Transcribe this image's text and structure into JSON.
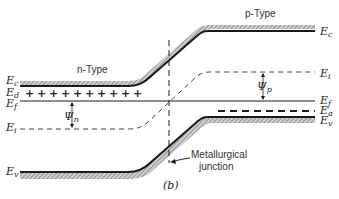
{
  "figure": {
    "caption": "(b)",
    "regions": {
      "n_type": "n-Type",
      "p_type": "p-Type"
    },
    "junction_label_line1": "Metallurgical",
    "junction_label_line2": "junction",
    "levels": {
      "Ec_left": {
        "main": "E",
        "sub": "c"
      },
      "Ed": {
        "main": "E",
        "sub": "d"
      },
      "Ef_left": {
        "main": "E",
        "sub": "f"
      },
      "Ei_left": {
        "main": "E",
        "sub": "i"
      },
      "Ev_left": {
        "main": "E",
        "sub": "v"
      },
      "Ec_right": {
        "main": "E",
        "sub": "c"
      },
      "Ei_right": {
        "main": "E",
        "sub": "i"
      },
      "Ef_right": {
        "main": "E",
        "sub": "f"
      },
      "Ea": {
        "main": "E",
        "sub": "a"
      },
      "Ev_right": {
        "main": "E",
        "sub": "v"
      }
    },
    "potentials": {
      "psi_n": {
        "main": "Ψ",
        "sub": "n"
      },
      "psi_p": {
        "main": "Ψ",
        "sub": "p"
      }
    },
    "donor_symbol": "+",
    "donor_count": 10,
    "colors": {
      "line": "#1a1a1a",
      "hatch": "#9a9a9a",
      "dash": "#444444"
    }
  }
}
